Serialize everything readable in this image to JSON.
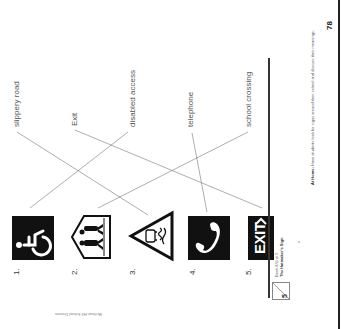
{
  "worksheet": {
    "labels": [
      {
        "text": "slippery road",
        "matches_sign": 3
      },
      {
        "text": "Exit",
        "matches_sign": 5
      },
      {
        "text": "disabled access",
        "matches_sign": 1
      },
      {
        "text": "telephone",
        "matches_sign": 4
      },
      {
        "text": "school crossing",
        "matches_sign": 2
      }
    ],
    "signs": [
      {
        "number": "1.",
        "icon": "wheelchair-icon"
      },
      {
        "number": "2.",
        "icon": "school-crossing-icon"
      },
      {
        "number": "3.",
        "icon": "slippery-road-icon"
      },
      {
        "number": "4.",
        "icon": "telephone-icon"
      },
      {
        "number": "5.",
        "icon": "exit-sign-icon",
        "sign_text": "EXIT"
      }
    ]
  },
  "footer": {
    "unit_badge": "5",
    "book_unit": "Book 4/Unit 3",
    "story_title": "The Hatmaker's Sign",
    "at_home_label": "At Home:",
    "at_home_text": "Have students look for signs around their school and discuss their meanings.",
    "page_number": "78",
    "credit": "McGraw-Hill School Division"
  }
}
